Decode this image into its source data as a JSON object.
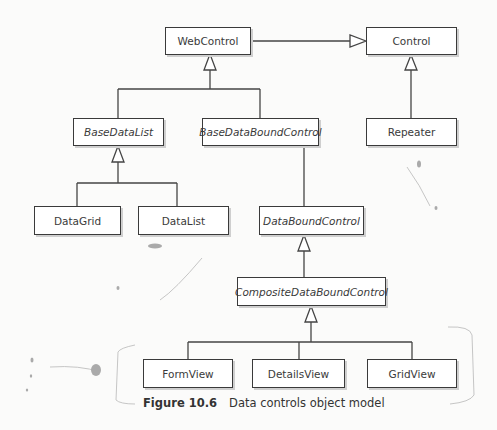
{
  "classes": {
    "webcontrol": "WebControl",
    "control": "Control",
    "basedatalist": "BaseDataList",
    "basedataboundcontrol": "BaseDataBoundControl",
    "repeater": "Repeater",
    "datagrid": "DataGrid",
    "datalist": "DataList",
    "databoundcontrol": "DataBoundControl",
    "compositedataboundcontrol": "CompositeDataBoundControl",
    "formview": "FormView",
    "detailsview": "DetailsView",
    "gridview": "GridView"
  },
  "relationships": [
    {
      "child": "WebControl",
      "parent": "Control"
    },
    {
      "child": "Repeater",
      "parent": "Control"
    },
    {
      "child": "BaseDataList",
      "parent": "WebControl"
    },
    {
      "child": "BaseDataBoundControl",
      "parent": "WebControl"
    },
    {
      "child": "DataGrid",
      "parent": "BaseDataList"
    },
    {
      "child": "DataList",
      "parent": "BaseDataList"
    },
    {
      "child": "DataBoundControl",
      "parent": "BaseDataBoundControl"
    },
    {
      "child": "CompositeDataBoundControl",
      "parent": "DataBoundControl"
    },
    {
      "child": "FormView",
      "parent": "CompositeDataBoundControl"
    },
    {
      "child": "DetailsView",
      "parent": "CompositeDataBoundControl"
    },
    {
      "child": "GridView",
      "parent": "CompositeDataBoundControl"
    }
  ],
  "caption": {
    "figure": "Figure 10.6",
    "text": "Data controls object model"
  }
}
